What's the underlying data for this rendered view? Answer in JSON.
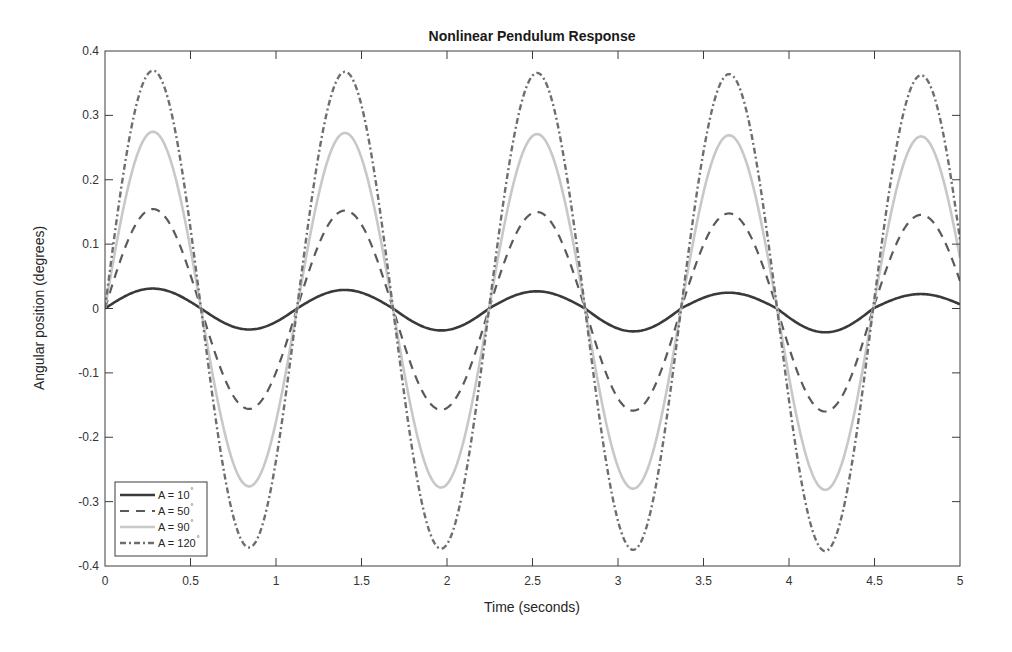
{
  "chart_data": {
    "type": "line",
    "title": "Nonlinear Pendulum Response",
    "xlabel": "Time (seconds)",
    "ylabel": "Angular position (degrees)",
    "xlim": [
      0,
      5
    ],
    "ylim": [
      -0.4,
      0.4
    ],
    "xticks": [
      0,
      0.5,
      1,
      1.5,
      2,
      2.5,
      3,
      3.5,
      4,
      4.5,
      5
    ],
    "xtick_labels": [
      "0",
      "0.5",
      "1",
      "1.5",
      "2",
      "2.5",
      "3",
      "3.5",
      "4",
      "4.5",
      "5"
    ],
    "yticks": [
      -0.4,
      -0.3,
      -0.2,
      -0.1,
      0,
      0.1,
      0.2,
      0.3,
      0.4
    ],
    "ytick_labels": [
      "-0.4",
      "-0.3",
      "-0.2",
      "-0.1",
      "0",
      "0.1",
      "0.2",
      "0.3",
      "0.4"
    ],
    "grid": false,
    "legend_position": "lower left",
    "period_s": 1.123,
    "series": [
      {
        "name": "A = 10°",
        "legend_label": "A = 10",
        "degree_symbol": "°",
        "style": "solid",
        "color": "#3a3a3a",
        "width": 2.6,
        "dash": "",
        "peak_times": [
          0.28,
          1.4,
          2.52,
          3.65,
          4.77
        ],
        "peak_values": [
          0.03,
          0.028,
          0.025,
          0.023,
          0.02
        ],
        "trough_times": [
          0.84,
          1.96,
          3.08,
          4.2
        ],
        "trough_values": [
          -0.033,
          -0.035,
          -0.037,
          -0.04
        ],
        "amplitude_start": 0.0315,
        "amplitude_end": 0.03,
        "offset_start": 0.0,
        "offset_end": -0.01
      },
      {
        "name": "A = 50°",
        "legend_label": "A = 50",
        "degree_symbol": "°",
        "style": "dashed",
        "color": "#5a5a5a",
        "width": 2.2,
        "dash": "9,7",
        "peak_times": [
          0.28,
          1.4,
          2.52,
          3.65,
          4.77
        ],
        "peak_values": [
          0.155,
          0.152,
          0.15,
          0.145,
          0.143
        ],
        "trough_times": [
          0.84,
          1.96,
          3.08,
          4.2
        ],
        "trough_values": [
          -0.155,
          -0.158,
          -0.162,
          -0.165
        ],
        "amplitude_start": 0.155,
        "amplitude_end": 0.153,
        "offset_start": 0.0,
        "offset_end": -0.01
      },
      {
        "name": "A = 90°",
        "legend_label": "A = 90",
        "degree_symbol": "°",
        "style": "solid-light",
        "color": "#c8c8c8",
        "width": 2.6,
        "dash": "",
        "peak_times": [
          0.28,
          1.4,
          2.52,
          3.65,
          4.77
        ],
        "peak_values": [
          0.275,
          0.275,
          0.27,
          0.268,
          0.265
        ],
        "trough_times": [
          0.84,
          1.96,
          3.08,
          4.2
        ],
        "trough_values": [
          -0.275,
          -0.278,
          -0.282,
          -0.285
        ],
        "amplitude_start": 0.275,
        "amplitude_end": 0.275,
        "offset_start": 0.0,
        "offset_end": -0.01
      },
      {
        "name": "A = 120°",
        "legend_label": "A = 120",
        "degree_symbol": "°",
        "style": "dash-dot",
        "color": "#6e6e6e",
        "width": 2.4,
        "dash": "6,3,2,3",
        "peak_times": [
          0.28,
          1.4,
          2.52,
          3.65,
          4.77
        ],
        "peak_values": [
          0.37,
          0.368,
          0.365,
          0.363,
          0.36
        ],
        "trough_times": [
          0.84,
          1.96,
          3.08,
          4.2
        ],
        "trough_values": [
          -0.37,
          -0.373,
          -0.376,
          -0.378
        ],
        "amplitude_start": 0.37,
        "amplitude_end": 0.37,
        "offset_start": 0.0,
        "offset_end": -0.01
      }
    ]
  },
  "layout": {
    "plot_left": 105,
    "plot_right": 960,
    "plot_top": 51,
    "plot_bottom": 566
  }
}
